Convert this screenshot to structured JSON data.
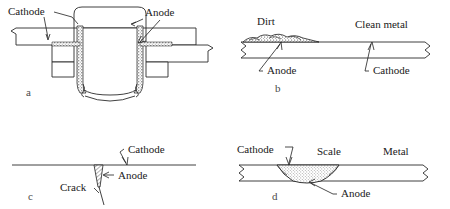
{
  "figure": {
    "line_color": "#2b2b2b",
    "text_color": "#1a1a1a",
    "background": "#ffffff"
  },
  "panels": [
    {
      "letter": "a",
      "name": "riveted-joint-crevice-corrosion",
      "labels": [
        {
          "text": "Cathode",
          "role": "cathode"
        },
        {
          "text": "Anode",
          "role": "anode"
        }
      ]
    },
    {
      "letter": "b",
      "name": "dirt-deposit-differential-aeration",
      "labels": [
        {
          "text": "Dirt",
          "role": "deposit"
        },
        {
          "text": "Clean metal",
          "role": "substrate"
        },
        {
          "text": "Anode",
          "role": "anode"
        },
        {
          "text": "Cathode",
          "role": "cathode"
        }
      ]
    },
    {
      "letter": "c",
      "name": "crack-corrosion-cell",
      "labels": [
        {
          "text": "Cathode",
          "role": "cathode"
        },
        {
          "text": "Anode",
          "role": "anode"
        },
        {
          "text": "Crack",
          "role": "defect"
        }
      ]
    },
    {
      "letter": "d",
      "name": "scale-pit-corrosion-cell",
      "labels": [
        {
          "text": "Cathode",
          "role": "cathode"
        },
        {
          "text": "Scale",
          "role": "deposit"
        },
        {
          "text": "Metal",
          "role": "substrate"
        },
        {
          "text": "Anode",
          "role": "anode"
        }
      ]
    }
  ]
}
